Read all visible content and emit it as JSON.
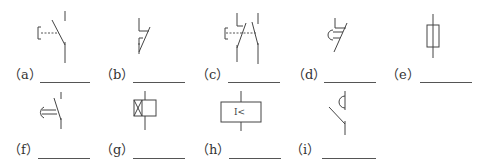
{
  "figure": {
    "type": "electrical-symbol-identification-exercise",
    "line_color": "#444444",
    "items": [
      {
        "id": "a",
        "label": "（a）",
        "symbol": "manual-pushbutton-switch-normally-open",
        "answer_blank": ""
      },
      {
        "id": "b",
        "label": "（b）",
        "symbol": "contactor-normally-closed-contact",
        "answer_blank": ""
      },
      {
        "id": "c",
        "label": "（c）",
        "symbol": "compound-pushbutton-switch",
        "answer_blank": ""
      },
      {
        "id": "d",
        "label": "（d）",
        "symbol": "time-delay-break-contact",
        "answer_blank": ""
      },
      {
        "id": "e",
        "label": "（e）",
        "symbol": "fuse",
        "answer_blank": ""
      },
      {
        "id": "f",
        "label": "（f）",
        "symbol": "time-delay-make-contact",
        "answer_blank": ""
      },
      {
        "id": "g",
        "label": "（g）",
        "symbol": "time-relay-coil-delayed",
        "answer_blank": ""
      },
      {
        "id": "h",
        "label": "（h）",
        "symbol": "undercurrent-relay-coil",
        "symbol_text": "I<",
        "answer_blank": ""
      },
      {
        "id": "i",
        "label": "（i）",
        "symbol": "time-delay-make-contact-alt",
        "answer_blank": ""
      }
    ]
  }
}
